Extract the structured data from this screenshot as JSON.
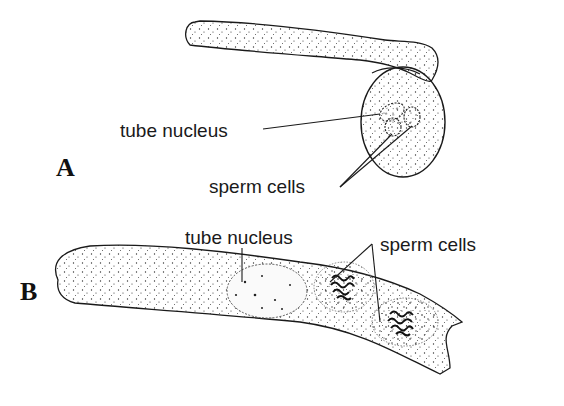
{
  "diagram": {
    "panels": [
      {
        "id": "A",
        "label": "A",
        "annotations": [
          {
            "text": "tube nucleus",
            "target": "tube nucleus inside pollen grain"
          },
          {
            "text": "sperm cells",
            "target": "two sperm cells inside pollen grain"
          }
        ]
      },
      {
        "id": "B",
        "label": "B",
        "annotations": [
          {
            "text": "tube nucleus",
            "target": "tube nucleus in pollen tube"
          },
          {
            "text": "sperm cells",
            "target": "two sperm cells in pollen tube"
          }
        ]
      }
    ],
    "colors": {
      "background": "#ffffff",
      "line": "#1a1a1a",
      "stipple": "#333333"
    }
  }
}
